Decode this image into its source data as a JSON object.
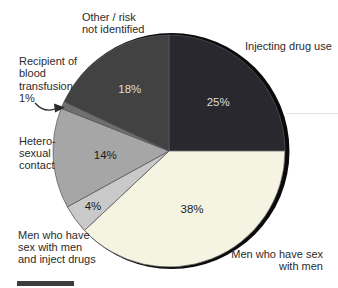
{
  "chart_data": {
    "type": "pie",
    "title": "",
    "start_angle": "12-oclock",
    "direction": "clockwise",
    "slices": [
      {
        "label": "Injecting drug use",
        "value": 25,
        "pct_label": "25%",
        "color": "#28282e",
        "pct_color": "#dedede"
      },
      {
        "label": "Men who have sex with men",
        "value": 38,
        "pct_label": "38%",
        "color": "#f5f4e2",
        "pct_color": "#1c1c1c"
      },
      {
        "label": "Men who have sex with men and inject drugs",
        "value": 4,
        "pct_label": "4%",
        "color": "#c9c9c9",
        "pct_color": "#1c1c1c"
      },
      {
        "label": "Hetero-sexual contact",
        "value": 14,
        "pct_label": "14%",
        "color": "#a6a6a6",
        "pct_color": "#1c1c1c"
      },
      {
        "label": "Recipient of blood transfusion",
        "value": 1,
        "pct_label": "1%",
        "color": "#6f6f6f",
        "pct_color": null
      },
      {
        "label": "Other / risk not identified",
        "value": 18,
        "pct_label": "18%",
        "color": "#424242",
        "pct_color": "#dedede"
      }
    ]
  },
  "callouts": {
    "other": "Other / risk\nnot identified",
    "injecting": "Injecting drug use",
    "blood": "Recipient of\nblood\ntransfusion\n1%",
    "hetero": "Hetero-\nsexual\ncontact",
    "msm_inject": "Men who have\nsex with men\nand inject drugs",
    "msm": "Men who have sex\nwith men"
  },
  "colors": {
    "background": "#ffffff",
    "shadow_rim": "#0b0b0b",
    "slice_stroke": "#5a5a5e",
    "label_text": "#2b2b2b",
    "bottom_bar": "#3d3d3d"
  }
}
